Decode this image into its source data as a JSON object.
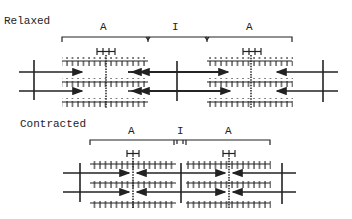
{
  "panels": [
    {
      "state_label": "Relaxed",
      "band_labels": {
        "a_left": "A",
        "i_band": "I",
        "a_right": "A"
      },
      "h_zone_label": "H-H"
    },
    {
      "state_label": "Contracted",
      "band_labels": {
        "a_left": "A",
        "i_band": "I",
        "a_right": "A"
      },
      "h_zone_label": "H-H"
    }
  ],
  "colors": {
    "ink": "#222222",
    "background": "#ffffff"
  }
}
